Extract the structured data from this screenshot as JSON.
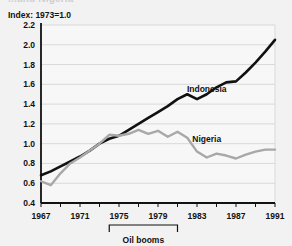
{
  "figure": {
    "clipped_title": "...and Nigeria",
    "axis_note": "Index: 1973=1.0",
    "series_label_indonesia": "Indonesia",
    "series_label_nigeria": "Nigeria",
    "bracket_label": "Oil booms"
  },
  "colors": {
    "background": "#f2f2f2",
    "plot_background": "#f7f7f7",
    "gridline": "#d9d9d9",
    "axis": "#111111",
    "indonesia": "#111111",
    "nigeria": "#a8a8a8",
    "text": "#111111"
  },
  "chart_data": {
    "type": "line",
    "title": "",
    "subtitle": "Index: 1973=1.0",
    "xlabel": "",
    "ylabel": "Index: 1973=1.0",
    "xlim": [
      1967,
      1991
    ],
    "ylim": [
      0.4,
      2.2
    ],
    "grid": true,
    "legend": "inline-annotation",
    "xticklabels": [
      "1967",
      "1971",
      "1975",
      "1979",
      "1983",
      "1987",
      "1991"
    ],
    "xticks": [
      1967,
      1971,
      1975,
      1979,
      1983,
      1987,
      1991
    ],
    "yticklabels": [
      "0.4",
      "0.6",
      "0.8",
      "1.0",
      "1.2",
      "1.4",
      "1.6",
      "1.8",
      "2.0",
      "2.2"
    ],
    "yticks": [
      0.4,
      0.6,
      0.8,
      1.0,
      1.2,
      1.4,
      1.6,
      1.8,
      2.0,
      2.2
    ],
    "x": [
      1967,
      1968,
      1969,
      1970,
      1971,
      1972,
      1973,
      1974,
      1975,
      1976,
      1977,
      1978,
      1979,
      1980,
      1981,
      1982,
      1983,
      1984,
      1985,
      1986,
      1987,
      1988,
      1989,
      1990,
      1991
    ],
    "series": [
      {
        "name": "Indonesia",
        "color": "#111111",
        "values": [
          0.68,
          0.72,
          0.77,
          0.82,
          0.87,
          0.93,
          1.0,
          1.05,
          1.08,
          1.14,
          1.2,
          1.26,
          1.32,
          1.38,
          1.45,
          1.5,
          1.45,
          1.5,
          1.57,
          1.62,
          1.63,
          1.72,
          1.82,
          1.93,
          2.05
        ],
        "label_position": {
          "x": 1984,
          "y": 1.52
        }
      },
      {
        "name": "Nigeria",
        "color": "#a8a8a8",
        "values": [
          0.62,
          0.58,
          0.7,
          0.8,
          0.86,
          0.93,
          1.0,
          1.09,
          1.08,
          1.1,
          1.14,
          1.1,
          1.13,
          1.07,
          1.12,
          1.06,
          0.92,
          0.86,
          0.9,
          0.88,
          0.85,
          0.89,
          0.92,
          0.94,
          0.94
        ],
        "label_position": {
          "x": 1984,
          "y": 1.02
        }
      }
    ],
    "annotations": [
      {
        "type": "bracket",
        "label": "Oil booms",
        "x_start": 1974,
        "x_end": 1981
      }
    ]
  }
}
